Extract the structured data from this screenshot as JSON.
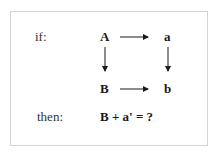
{
  "diagram": {
    "labels": {
      "if": "if:",
      "then": "then:"
    },
    "nodes": {
      "A": "A",
      "a": "a",
      "B": "B",
      "b": "b"
    },
    "arrows": [
      {
        "from": "A",
        "to": "a",
        "direction": "right"
      },
      {
        "from": "A",
        "to": "B",
        "direction": "down"
      },
      {
        "from": "a",
        "to": "b",
        "direction": "down"
      },
      {
        "from": "B",
        "to": "b",
        "direction": "right"
      }
    ],
    "question": "B + a' = ?"
  },
  "colors": {
    "text": "#1a1a1a",
    "border": "#d4d4d4",
    "arrow": "#1a1a1a"
  }
}
